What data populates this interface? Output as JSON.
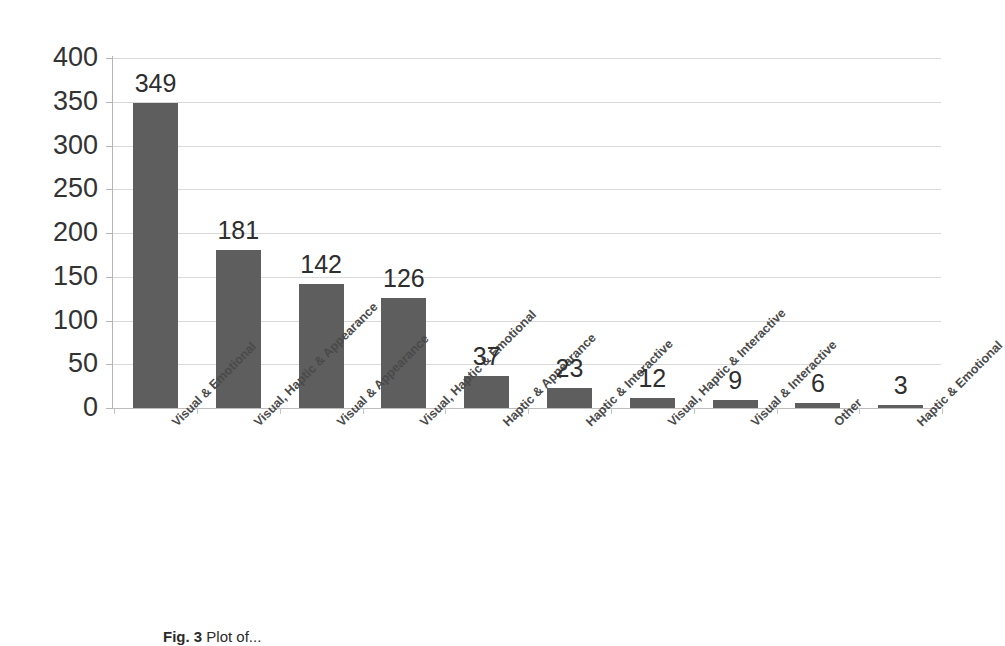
{
  "chart_data": {
    "type": "bar",
    "title": "",
    "subtitle": "",
    "xlabel": "",
    "ylabel": "",
    "ylim": [
      0,
      400
    ],
    "ytick_step": 50,
    "yticks": [
      400,
      350,
      300,
      250,
      200,
      150,
      100,
      50,
      0
    ],
    "ytick_labels": [
      "400",
      "350",
      "300",
      "250",
      "200",
      "150",
      "100",
      "50",
      "0"
    ],
    "grid": true,
    "grid_axis": "y",
    "legend": false,
    "legend_position": "none",
    "orientation": "vertical",
    "data_labels": true,
    "bar_color": "#5e5e5e",
    "grid_color": "#d9d9d9",
    "axis_color": "#b5b5b5",
    "background_color": "#ffffff",
    "categories": [
      "Visual & Emotional",
      "Visual, Haptic & Appearance",
      "Visual & Appearance",
      "Visual, Haptic & Emotional",
      "Haptic & Appearance",
      "Haptic & Interactive",
      "Visual, Haptic & Interactive",
      "Visual & Interactive",
      "Other",
      "Haptic & Emotional"
    ],
    "values": [
      349,
      181,
      142,
      126,
      37,
      23,
      12,
      9,
      6,
      3
    ],
    "value_labels": [
      "349",
      "181",
      "142",
      "126",
      "37",
      "23",
      "12",
      "9",
      "6",
      "3"
    ]
  },
  "caption": {
    "figure_number": "Fig. 3",
    "text": "Plot of..."
  }
}
